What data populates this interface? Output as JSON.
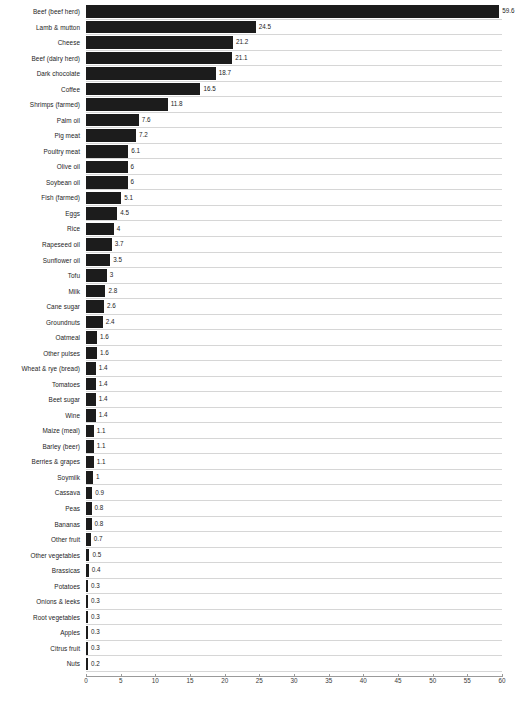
{
  "chart_data": {
    "type": "bar",
    "orientation": "horizontal",
    "title": "",
    "subtitle": "",
    "xlabel": "",
    "ylabel": "",
    "xlim": [
      0,
      60
    ],
    "xticks": [
      0,
      5,
      10,
      15,
      20,
      25,
      30,
      35,
      40,
      45,
      50,
      55,
      60
    ],
    "grid": "horizontal-only",
    "legend": "none",
    "bar_color": "#1c1c1c",
    "gridline_color": "#d6d6d6",
    "axis_color": "#9a9a9a",
    "value_labels_shown": true,
    "categories": [
      "Beef (beef herd)",
      "Lamb & mutton",
      "Cheese",
      "Beef (dairy herd)",
      "Dark chocolate",
      "Coffee",
      "Shrimps (farmed)",
      "Palm oil",
      "Pig meat",
      "Poultry meat",
      "Olive oil",
      "Soybean oil",
      "Fish (farmed)",
      "Eggs",
      "Rice",
      "Rapeseed oil",
      "Sunflower oil",
      "Tofu",
      "Milk",
      "Cane sugar",
      "Groundnuts",
      "Oatmeal",
      "Other pulses",
      "Wheat & rye (bread)",
      "Tomatoes",
      "Beet sugar",
      "Wine",
      "Maize (meal)",
      "Barley (beer)",
      "Berries & grapes",
      "Soymilk",
      "Cassava",
      "Peas",
      "Bananas",
      "Other fruit",
      "Other vegetables",
      "Brassicas",
      "Potatoes",
      "Onions & leeks",
      "Root vegetables",
      "Apples",
      "Citrus fruit",
      "Nuts"
    ],
    "values": [
      59.6,
      24.5,
      21.2,
      21.1,
      18.7,
      16.5,
      11.8,
      7.6,
      7.2,
      6.1,
      6,
      6,
      5.1,
      4.5,
      4,
      3.7,
      3.5,
      3,
      2.8,
      2.6,
      2.4,
      1.6,
      1.6,
      1.4,
      1.4,
      1.4,
      1.4,
      1.1,
      1.1,
      1.1,
      1,
      0.9,
      0.8,
      0.8,
      0.7,
      0.5,
      0.4,
      0.3,
      0.3,
      0.3,
      0.3,
      0.3,
      0.2
    ],
    "value_labels": [
      "59.6",
      "24.5",
      "21.2",
      "21.1",
      "18.7",
      "16.5",
      "11.8",
      "7.6",
      "7.2",
      "6.1",
      "6",
      "6",
      "5.1",
      "4.5",
      "4",
      "3.7",
      "3.5",
      "3",
      "2.8",
      "2.6",
      "2.4",
      "1.6",
      "1.6",
      "1.4",
      "1.4",
      "1.4",
      "1.4",
      "1.1",
      "1.1",
      "1.1",
      "1",
      "0.9",
      "0.8",
      "0.8",
      "0.7",
      "0.5",
      "0.4",
      "0.3",
      "0.3",
      "0.3",
      "0.3",
      "0.3",
      "0.2"
    ]
  }
}
